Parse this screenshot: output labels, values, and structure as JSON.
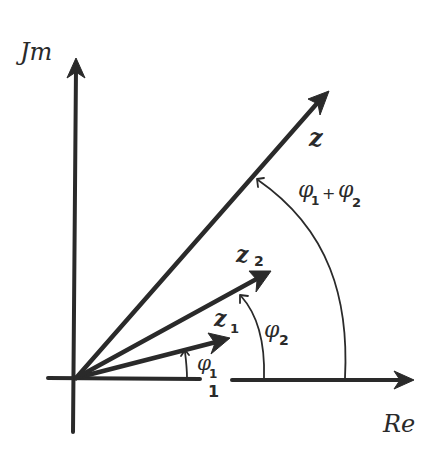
{
  "diagram": {
    "axes": {
      "imaginary_label": "Jm",
      "real_label": "Re",
      "unit_tick_label": "1"
    },
    "vectors": [
      {
        "id": "z1",
        "label_main": "z",
        "label_sub": "1",
        "angle_label": "φ",
        "angle_sub": "1"
      },
      {
        "id": "z2",
        "label_main": "z",
        "label_sub": "2",
        "angle_label": "φ",
        "angle_sub": "2"
      },
      {
        "id": "z",
        "label_main": "z",
        "label_sub": "",
        "angle_label": "φ₁+φ₂"
      }
    ],
    "angle_sum": {
      "phi": "φ",
      "sub1": "1",
      "plus": "+",
      "sub2": "2"
    },
    "colors": {
      "ink": "#2a2a2a",
      "background": "#ffffff"
    }
  }
}
